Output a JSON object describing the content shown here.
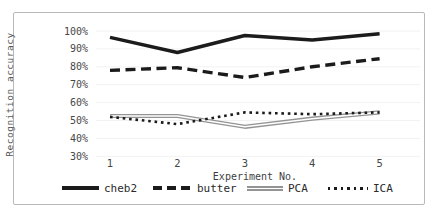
{
  "frame": {
    "border_color": "#b9b9b9",
    "background": "#ffffff"
  },
  "chart_data": {
    "type": "line",
    "title": "",
    "xlabel": "Experiment No.",
    "ylabel": "Recognition accuracy",
    "categories": [
      "1",
      "2",
      "3",
      "4",
      "5"
    ],
    "y_tick_labels": [
      "100%",
      "90%",
      "80%",
      "70%",
      "60%",
      "50%",
      "40%",
      "30%"
    ],
    "y_tick_values": [
      100,
      90,
      80,
      70,
      60,
      50,
      40,
      30
    ],
    "ylim": [
      30,
      100
    ],
    "grid": "faint-horizontal",
    "legend_position": "bottom",
    "series": [
      {
        "name": "cheb2",
        "line_style": "solid-thick",
        "color": "#1b1b1b",
        "values": [
          96.5,
          88,
          97.5,
          95,
          98.5
        ]
      },
      {
        "name": "butter",
        "line_style": "dashed",
        "color": "#1b1b1b",
        "values": [
          78,
          79.5,
          74,
          80,
          84.5
        ]
      },
      {
        "name": "PCA",
        "line_style": "double",
        "color": "#949494",
        "values": [
          52.5,
          52.5,
          46.5,
          51,
          54.5
        ]
      },
      {
        "name": "ICA",
        "line_style": "dotted",
        "color": "#1b1b1b",
        "values": [
          52,
          48,
          54.5,
          53.5,
          54.5
        ]
      }
    ]
  }
}
